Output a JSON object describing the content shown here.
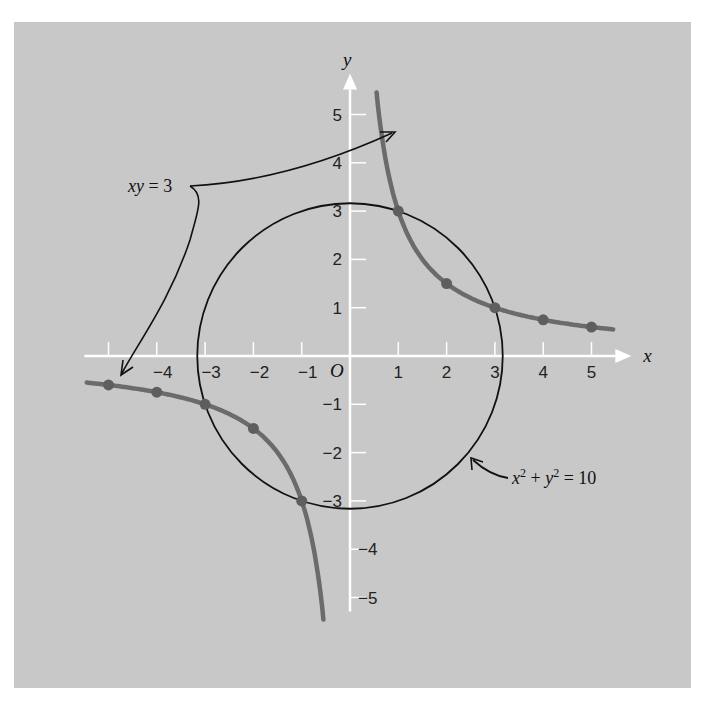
{
  "chart_data": {
    "type": "line",
    "title": "",
    "xlabel": "x",
    "ylabel": "y",
    "origin_label": "O",
    "xlim": [
      -5.5,
      5.7
    ],
    "ylim": [
      -5.6,
      5.6
    ],
    "grid": false,
    "x_ticks": [
      -5,
      -4,
      -3,
      -2,
      -1,
      1,
      2,
      3,
      4,
      5
    ],
    "x_tick_labels": [
      "−4",
      "−3",
      "−2",
      "−1",
      "1",
      "2",
      "3",
      "4",
      "5"
    ],
    "x_tick_label_values": [
      -4,
      -3,
      -2,
      -1,
      1,
      2,
      3,
      4,
      5
    ],
    "y_ticks": [
      -5,
      -4,
      -3,
      -2,
      -1,
      1,
      2,
      3,
      4,
      5
    ],
    "y_tick_labels": [
      "5",
      "4",
      "3",
      "2",
      "1",
      "−1",
      "−2",
      "−3",
      "−4",
      "−5"
    ],
    "y_tick_label_values": [
      5,
      4,
      3,
      2,
      1,
      -1,
      -2,
      -3,
      -4,
      -5
    ],
    "series": [
      {
        "name": "xy = 3",
        "equation": "xy = 3",
        "kind": "hyperbola",
        "color": "#6b6b6b",
        "points_marked": [
          {
            "x": 1,
            "y": 3
          },
          {
            "x": 2,
            "y": 1.5
          },
          {
            "x": 3,
            "y": 1
          },
          {
            "x": 4,
            "y": 0.75
          },
          {
            "x": 5,
            "y": 0.6
          },
          {
            "x": -1,
            "y": -3
          },
          {
            "x": -2,
            "y": -1.5
          },
          {
            "x": -3,
            "y": -1
          },
          {
            "x": -4,
            "y": -0.75
          },
          {
            "x": -5,
            "y": -0.6
          }
        ],
        "x_range_pos": [
          0.55,
          5.45
        ],
        "x_range_neg": [
          -5.45,
          -0.55
        ]
      },
      {
        "name": "x² + y² = 10",
        "equation": "x^2 + y^2 = 10",
        "kind": "circle",
        "radius_squared": 10,
        "color": "#111111"
      }
    ],
    "intersections": [
      {
        "x": 1,
        "y": 3
      },
      {
        "x": 3,
        "y": 1
      },
      {
        "x": -1,
        "y": -3
      },
      {
        "x": -3,
        "y": -1
      }
    ],
    "annotations": [
      {
        "text_parts": [
          "xy",
          " = 3"
        ],
        "target": "xy = 3",
        "position": "upper-left"
      },
      {
        "text_parts": [
          "x",
          "2",
          " + ",
          "y",
          "2",
          " = 10"
        ],
        "target": "x² + y² = 10",
        "position": "lower-right"
      }
    ]
  },
  "colors": {
    "background": "#c8c8c8",
    "axes": "#ffffff",
    "hyperbola": "#6b6b6b",
    "circle": "#111111"
  }
}
